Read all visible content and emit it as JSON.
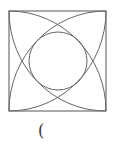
{
  "diagram": {
    "type": "geometry",
    "square": {
      "x": 9,
      "y": 11,
      "side": 97
    },
    "circle": {
      "cx": 58,
      "cy": 61,
      "r": 29
    },
    "stroke_color": "#555555",
    "label": "("
  }
}
